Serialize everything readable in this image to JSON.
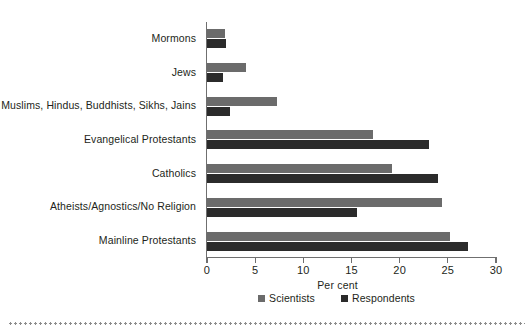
{
  "chart_data": {
    "type": "bar",
    "orientation": "horizontal",
    "title": "",
    "subtitle": "",
    "xlabel": "Per cent",
    "ylabel": "",
    "xlim": [
      0,
      30
    ],
    "xticks": [
      0,
      5,
      10,
      15,
      20,
      25,
      30
    ],
    "xtick_labels": [
      "0",
      "5",
      "10",
      "15",
      "20",
      "25",
      "30"
    ],
    "grid": false,
    "legend_position": "bottom-center",
    "categories": [
      "Mormons",
      "Jews",
      "Muslims, Hindus, Buddhists, Sikhs, Jains",
      "Evangelical Protestants",
      "Catholics",
      "Atheists/Agnostics/No Religion",
      "Mainline Protestants"
    ],
    "series": [
      {
        "name": "Scientists",
        "color": "#6b6b6b",
        "values": [
          1.9,
          4.0,
          7.3,
          17.2,
          19.2,
          24.4,
          25.2
        ]
      },
      {
        "name": "Respondents",
        "color": "#2b2b2b",
        "values": [
          2.0,
          1.7,
          2.4,
          23.0,
          24.0,
          15.6,
          27.1
        ]
      }
    ]
  },
  "axis": {
    "x_title": "Per cent"
  },
  "legend": {
    "items": [
      {
        "label": "Scientists",
        "color": "#6b6b6b",
        "swatch_name": "legend-swatch-scientists"
      },
      {
        "label": "Respondents",
        "color": "#2b2b2b",
        "swatch_name": "legend-swatch-respondents"
      }
    ]
  },
  "colors": {
    "scientists": "#6b6b6b",
    "respondents": "#2b2b2b",
    "axis": "#6f6f6f",
    "text": "#231f20",
    "background": "#ffffff",
    "rule": "#8d8d8d"
  }
}
